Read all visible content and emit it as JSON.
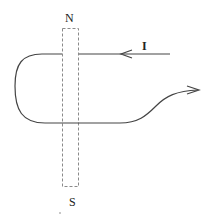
{
  "diagram": {
    "magnet": {
      "north_label": "N",
      "south_label": "S"
    },
    "wire": {
      "current_label": "I"
    },
    "colors": {
      "wire": "#444444",
      "magnet_outline": "#888888",
      "text": "#222222"
    }
  }
}
